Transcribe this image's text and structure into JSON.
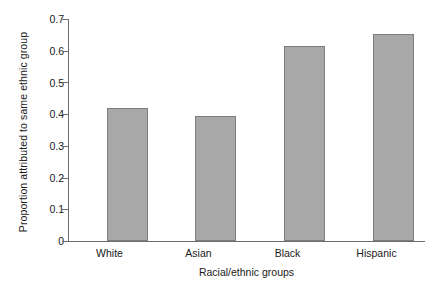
{
  "chart_data": {
    "type": "bar",
    "title": "",
    "subtitle": "",
    "xlabel": "Racial/ethnic groups",
    "ylabel": "Proportion attributed to same ethnic group",
    "categories": [
      "White",
      "Asian",
      "Black",
      "Hispanic"
    ],
    "values": [
      0.42,
      0.395,
      0.615,
      0.653
    ],
    "series": [
      {
        "name": "Proportion attributed to same ethnic group",
        "values": [
          0.42,
          0.395,
          0.615,
          0.653
        ]
      }
    ],
    "ylim": [
      0,
      0.7
    ],
    "ytick_labels": [
      "0.7",
      "0.6",
      "0.5",
      "0.4",
      "0.3",
      "0.2",
      "0.1",
      "0"
    ],
    "ytick_values": [
      0.7,
      0.6,
      0.5,
      0.4,
      0.3,
      0.2,
      0.1,
      0
    ],
    "grid": false,
    "legend": false,
    "legend_position": "none",
    "bar_fill_color": "#a8a8a8",
    "bar_edge_color": "#7d7d7d",
    "axis_color": "#6e6e6e",
    "background_color": "#ffffff"
  }
}
